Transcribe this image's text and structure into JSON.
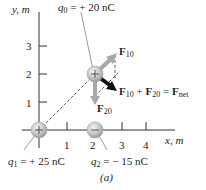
{
  "figure": {
    "caption": "(a)",
    "axes": {
      "x_label": "x, m",
      "y_label": "y, m",
      "x_ticks": [
        "1",
        "2",
        "3",
        "4"
      ],
      "y_ticks": [
        "1",
        "2",
        "3"
      ]
    },
    "charges": [
      {
        "name": "q0",
        "symbol": "q",
        "subscript": "0",
        "value_text": "= + 20 nC",
        "sign": "+",
        "position_m": [
          2,
          2
        ]
      },
      {
        "name": "q1",
        "symbol": "q",
        "subscript": "1",
        "value_text": "= + 25 nC",
        "sign": "+",
        "position_m": [
          0,
          0
        ]
      },
      {
        "name": "q2",
        "symbol": "q",
        "subscript": "2",
        "value_text": "= − 15 nC",
        "sign": "−",
        "position_m": [
          2,
          0
        ]
      }
    ],
    "forces": {
      "f10": {
        "main": "F",
        "sub": "10"
      },
      "f20": {
        "main": "F",
        "sub": "20"
      },
      "net": {
        "a": "F",
        "a_sub": "10",
        "plus": "+",
        "b": "F",
        "b_sub": "20",
        "eq": "=",
        "c": "F",
        "c_sub": "net"
      }
    },
    "colors": {
      "axis": "#333333",
      "force_arrow": "#a8a8a8",
      "net_arrow": "#111111",
      "charge_fill": "#c8c8c8",
      "dashed": "#333333"
    }
  }
}
